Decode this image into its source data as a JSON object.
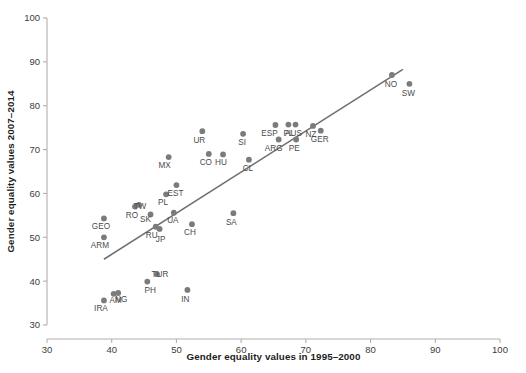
{
  "chart_data": {
    "type": "scatter",
    "title": "",
    "xlabel": "Gender equality values in 1995–2000",
    "ylabel": "Gender equality values 2007–2014",
    "xlim": [
      30,
      100
    ],
    "ylim": [
      30,
      100
    ],
    "xticks": [
      30,
      40,
      50,
      60,
      70,
      80,
      90,
      100
    ],
    "yticks": [
      30,
      40,
      50,
      60,
      70,
      80,
      90,
      100
    ],
    "grid": false,
    "legend": "none",
    "point_color": "#7b7b7b",
    "line_color": "#6f6f6f",
    "trendline": {
      "x": [
        38.8,
        85.0
      ],
      "y": [
        45.0,
        88.3
      ]
    },
    "points": [
      {
        "label": "GEO",
        "x": 38.8,
        "y": 54.3,
        "label_dx": -3,
        "label_dy": 11
      },
      {
        "label": "ARM",
        "x": 38.8,
        "y": 50.0,
        "label_dx": -4,
        "label_dy": 11
      },
      {
        "label": "IRA",
        "x": 38.8,
        "y": 35.6,
        "label_dx": -3,
        "label_dy": 11
      },
      {
        "label": "AM",
        "x": 40.3,
        "y": 37.1,
        "label_dx": 2,
        "label_dy": 9
      },
      {
        "label": "NG",
        "x": 41.0,
        "y": 37.3,
        "label_dx": 3,
        "label_dy": 9
      },
      {
        "label": "RO",
        "x": 43.6,
        "y": 57.0,
        "label_dx": -3,
        "label_dy": 11
      },
      {
        "label": "TW",
        "x": 44.2,
        "y": 57.4,
        "label_dx": 1,
        "label_dy": 4
      },
      {
        "label": "SK",
        "x": 46.0,
        "y": 55.2,
        "label_dx": -5,
        "label_dy": 8
      },
      {
        "label": "RU",
        "x": 46.8,
        "y": 52.4,
        "label_dx": -4,
        "label_dy": 11
      },
      {
        "label": "JP",
        "x": 47.4,
        "y": 51.9,
        "label_dx": 1,
        "label_dy": 13
      },
      {
        "label": "PH",
        "x": 45.5,
        "y": 39.9,
        "label_dx": 3,
        "label_dy": 11
      },
      {
        "label": "TUR",
        "x": 47.0,
        "y": 41.6,
        "label_dx": 3,
        "label_dy": 3
      },
      {
        "label": "MX",
        "x": 48.8,
        "y": 68.3,
        "label_dx": -4,
        "label_dy": 11
      },
      {
        "label": "PL",
        "x": 48.4,
        "y": 59.8,
        "label_dx": -3,
        "label_dy": 11
      },
      {
        "label": "UA",
        "x": 49.6,
        "y": 55.6,
        "label_dx": -1,
        "label_dy": 10
      },
      {
        "label": "EST",
        "x": 50.0,
        "y": 61.9,
        "label_dx": -1,
        "label_dy": 11
      },
      {
        "label": "IN",
        "x": 51.7,
        "y": 38.0,
        "label_dx": -2,
        "label_dy": 12
      },
      {
        "label": "CH",
        "x": 52.4,
        "y": 53.0,
        "label_dx": -2,
        "label_dy": 11
      },
      {
        "label": "UR",
        "x": 54.0,
        "y": 74.2,
        "label_dx": -3,
        "label_dy": 12
      },
      {
        "label": "CO",
        "x": 55.0,
        "y": 69.0,
        "label_dx": -3,
        "label_dy": 11
      },
      {
        "label": "HU",
        "x": 57.2,
        "y": 68.9,
        "label_dx": -2,
        "label_dy": 11
      },
      {
        "label": "SA",
        "x": 58.8,
        "y": 55.5,
        "label_dx": -2,
        "label_dy": 12
      },
      {
        "label": "SI",
        "x": 60.3,
        "y": 73.6,
        "label_dx": -1,
        "label_dy": 11
      },
      {
        "label": "CL",
        "x": 61.2,
        "y": 67.7,
        "label_dx": -1,
        "label_dy": 11
      },
      {
        "label": "ESP",
        "x": 65.3,
        "y": 75.6,
        "label_dx": -6,
        "label_dy": 11
      },
      {
        "label": "ARG",
        "x": 65.8,
        "y": 72.3,
        "label_dx": -5,
        "label_dy": 12
      },
      {
        "label": "PL2",
        "x": 67.3,
        "y": 75.7,
        "label_dx": 0,
        "label_dy": 11
      },
      {
        "label": "AUS",
        "x": 68.4,
        "y": 75.7,
        "label_dx": -2,
        "label_dy": 11
      },
      {
        "label": "PE",
        "x": 68.5,
        "y": 72.3,
        "label_dx": -2,
        "label_dy": 12
      },
      {
        "label": "NZ",
        "x": 71.1,
        "y": 75.4,
        "label_dx": -2,
        "label_dy": 11
      },
      {
        "label": "GER",
        "x": 72.3,
        "y": 74.3,
        "label_dx": -1,
        "label_dy": 11
      },
      {
        "label": "NO",
        "x": 83.3,
        "y": 87.0,
        "label_dx": -1,
        "label_dy": 12
      },
      {
        "label": "SW",
        "x": 86.0,
        "y": 85.0,
        "label_dx": -1,
        "label_dy": 12
      }
    ]
  }
}
